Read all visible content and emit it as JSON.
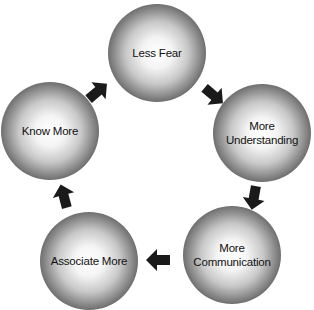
{
  "diagram": {
    "type": "cycle",
    "nodes": [
      {
        "id": "less-fear",
        "label": "Less Fear"
      },
      {
        "id": "more-understanding",
        "label": "More\nUnderstanding"
      },
      {
        "id": "more-communication",
        "label": "More\nCommunication"
      },
      {
        "id": "associate-more",
        "label": "Associate More"
      },
      {
        "id": "know-more",
        "label": "Know More"
      }
    ],
    "edges": [
      {
        "from": "less-fear",
        "to": "more-understanding"
      },
      {
        "from": "more-understanding",
        "to": "more-communication"
      },
      {
        "from": "more-communication",
        "to": "associate-more"
      },
      {
        "from": "associate-more",
        "to": "know-more"
      },
      {
        "from": "know-more",
        "to": "less-fear"
      }
    ],
    "colors": {
      "node_center": "#ffffff",
      "node_edge": "#202020",
      "arrow": "#1a1a1a"
    }
  }
}
